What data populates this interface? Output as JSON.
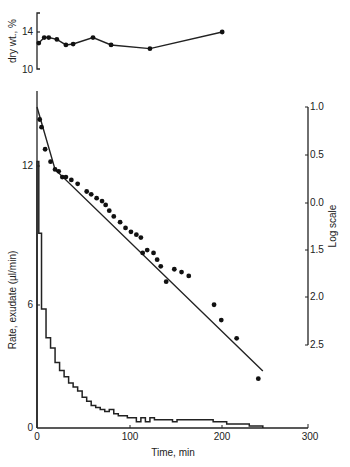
{
  "chart_data": [
    {
      "type": "line",
      "title": "",
      "xlabel": "",
      "ylabel": "dry wt., %",
      "ylim": [
        10,
        16
      ],
      "yticks": [
        "10",
        "14"
      ],
      "x": [
        2,
        8,
        13,
        22,
        32,
        40,
        62,
        82,
        125,
        205
      ],
      "values": [
        12.8,
        13.4,
        13.4,
        13.2,
        12.6,
        12.7,
        13.4,
        12.6,
        12.2,
        14.0
      ]
    },
    {
      "type": "scatter",
      "title": "",
      "xlabel": "Time, min",
      "ylabel": "Log scale",
      "ylim_label_order": [
        "1.0",
        "0.5",
        "0.0",
        "1.5",
        "2.0",
        "2.5"
      ],
      "xlim": [
        0,
        300
      ],
      "xticks": [
        "0",
        "100",
        "200",
        "300"
      ],
      "points": [
        [
          3,
          0.87
        ],
        [
          5,
          0.79
        ],
        [
          9,
          0.56
        ],
        [
          15,
          0.43
        ],
        [
          20,
          0.35
        ],
        [
          24,
          0.33
        ],
        [
          28,
          0.27
        ],
        [
          32,
          0.27
        ],
        [
          38,
          0.24
        ],
        [
          45,
          0.2
        ],
        [
          55,
          0.12
        ],
        [
          60,
          0.09
        ],
        [
          66,
          0.05
        ],
        [
          72,
          0.02
        ],
        [
          76,
          -0.02
        ],
        [
          80,
          -0.08
        ],
        [
          85,
          -0.14
        ],
        [
          92,
          -0.2
        ],
        [
          98,
          -0.26
        ],
        [
          104,
          -0.3
        ],
        [
          110,
          -0.33
        ],
        [
          115,
          -0.36
        ],
        [
          117,
          -0.52
        ],
        [
          122,
          -0.49
        ],
        [
          129,
          -0.52
        ],
        [
          133,
          -0.59
        ],
        [
          137,
          -0.66
        ],
        [
          143,
          -0.82
        ],
        [
          152,
          -0.69
        ],
        [
          160,
          -0.72
        ],
        [
          168,
          -0.76
        ],
        [
          196,
          -1.06
        ],
        [
          204,
          -1.22
        ],
        [
          221,
          -1.41
        ],
        [
          245,
          -1.83
        ]
      ],
      "fit_line": [
        [
          0,
          1.0
        ],
        [
          20,
          0.35
        ],
        [
          250,
          -1.75
        ]
      ]
    },
    {
      "type": "bar",
      "title": "",
      "xlabel": "Time, min",
      "ylabel": "Rate, exudate (µl/min)",
      "ylim": [
        0,
        14
      ],
      "yticks": [
        "0",
        "6",
        "12"
      ],
      "xlim": [
        0,
        300
      ],
      "xticks": [
        "0",
        "100",
        "200",
        "300"
      ],
      "step_x": [
        0,
        2,
        5,
        10,
        15,
        20,
        25,
        30,
        35,
        40,
        45,
        50,
        55,
        60,
        65,
        70,
        75,
        80,
        85,
        90,
        95,
        100,
        110,
        115,
        120,
        125,
        130,
        150,
        155,
        190,
        195,
        210,
        235,
        250
      ],
      "values": [
        13.0,
        9.5,
        5.8,
        4.4,
        3.9,
        3.2,
        2.8,
        2.5,
        2.2,
        2.0,
        1.8,
        1.5,
        1.3,
        1.1,
        1.0,
        0.9,
        0.8,
        0.9,
        0.7,
        0.6,
        0.6,
        0.5,
        0.3,
        0.5,
        0.3,
        0.5,
        0.4,
        0.3,
        0.4,
        0.4,
        0.3,
        0.2,
        0.1,
        0.0
      ]
    }
  ],
  "axes": {
    "top_ylabel": "dry wt., %",
    "top_ticks": [
      "14",
      "10"
    ],
    "left_ylabel": "Rate, exudate (µl/min)",
    "left_ticks": [
      "12",
      "6",
      "0"
    ],
    "right_ylabel": "Log scale",
    "right_ticks": [
      "1.0",
      "0.5",
      "0.0",
      "1.5",
      "2.0",
      "2.5"
    ],
    "xlabel": "Time, min",
    "x_ticks": [
      "0",
      "100",
      "200",
      "300"
    ]
  }
}
